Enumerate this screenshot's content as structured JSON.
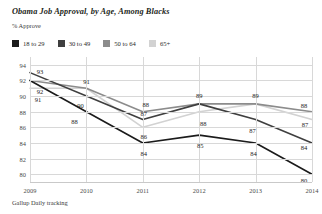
{
  "header": {
    "title": "Obama Job Approval, by Age, Among Blacks",
    "subtitle": "% Approve",
    "source": "Gallup Daily tracking"
  },
  "legend": {
    "items": [
      {
        "label": "18 to 29",
        "color": "#1b1b1b",
        "swatch_name": "legend-swatch-18-to-29"
      },
      {
        "label": "30 to 49",
        "color": "#3f3f3f",
        "swatch_name": "legend-swatch-30-to-49"
      },
      {
        "label": "50 to 64",
        "color": "#8c8c8c",
        "swatch_name": "legend-swatch-50-to-64"
      },
      {
        "label": "65+",
        "color": "#d2d2d2",
        "swatch_name": "legend-swatch-65-plus"
      }
    ]
  },
  "chart_data": {
    "type": "line",
    "title": "Obama Job Approval, by Age, Among Blacks",
    "subtitle": "% Approve",
    "xlabel": "",
    "ylabel": "% Approve",
    "categories": [
      "2009",
      "2010",
      "2011",
      "2012",
      "2013",
      "2014"
    ],
    "x": [
      2009,
      2010,
      2011,
      2012,
      2013,
      2014
    ],
    "ylim": [
      79,
      95
    ],
    "yticks": [
      80,
      82,
      84,
      86,
      88,
      90,
      92,
      94
    ],
    "grid": true,
    "legend_position": "top-left",
    "source": "Gallup Daily tracking",
    "series": [
      {
        "name": "18 to 29",
        "color": "#1b1b1b",
        "values": [
          92,
          88,
          84,
          85,
          84,
          80
        ],
        "labels": [
          "92",
          "88",
          "84",
          "85",
          "84",
          "80"
        ]
      },
      {
        "name": "30 to 49",
        "color": "#3f3f3f",
        "values": [
          93,
          90,
          87,
          89,
          87,
          84
        ],
        "labels": [
          "93",
          "90",
          "87",
          "89",
          "87",
          "84"
        ]
      },
      {
        "name": "50 to 64",
        "color": "#8c8c8c",
        "values": [
          92,
          91,
          88,
          89,
          89,
          88
        ],
        "labels": [
          "92",
          "91",
          "88",
          "89",
          "89",
          "88"
        ]
      },
      {
        "name": "65+",
        "color": "#d2d2d2",
        "values": [
          91,
          91,
          86,
          88,
          89,
          87
        ],
        "labels": [
          "91",
          "91",
          "86",
          "88",
          "89",
          "87"
        ]
      }
    ],
    "point_labels": [
      {
        "text": "93",
        "x": 2009,
        "y": 93,
        "dx": 10,
        "dy": -2
      },
      {
        "text": "92",
        "x": 2009,
        "y": 92,
        "dx": 10,
        "dy": 11
      },
      {
        "text": "91",
        "x": 2009,
        "y": 91,
        "dx": 8,
        "dy": 11
      },
      {
        "text": "91",
        "x": 2010,
        "y": 91,
        "dx": 0,
        "dy": -7
      },
      {
        "text": "90",
        "x": 2010,
        "y": 90,
        "dx": -6,
        "dy": 9
      },
      {
        "text": "88",
        "x": 2010,
        "y": 88,
        "dx": -12,
        "dy": 9
      },
      {
        "text": "88",
        "x": 2011,
        "y": 88,
        "dx": 3,
        "dy": -8
      },
      {
        "text": "87",
        "x": 2011,
        "y": 87,
        "dx": 1,
        "dy": -7
      },
      {
        "text": "86",
        "x": 2011,
        "y": 86,
        "dx": 1,
        "dy": 9
      },
      {
        "text": "84",
        "x": 2011,
        "y": 84,
        "dx": 1,
        "dy": 10
      },
      {
        "text": "89",
        "x": 2012,
        "y": 89,
        "dx": 0,
        "dy": -9
      },
      {
        "text": "88",
        "x": 2012,
        "y": 88,
        "dx": 4,
        "dy": 11
      },
      {
        "text": "85",
        "x": 2012,
        "y": 85,
        "dx": 1,
        "dy": 10
      },
      {
        "text": "89",
        "x": 2013,
        "y": 89,
        "dx": 0,
        "dy": -9
      },
      {
        "text": "87",
        "x": 2013,
        "y": 87,
        "dx": -3,
        "dy": 10
      },
      {
        "text": "84",
        "x": 2013,
        "y": 84,
        "dx": -2,
        "dy": 10
      },
      {
        "text": "88",
        "x": 2014,
        "y": 88,
        "dx": -8,
        "dy": -7
      },
      {
        "text": "87",
        "x": 2014,
        "y": 87,
        "dx": -7,
        "dy": 4
      },
      {
        "text": "84",
        "x": 2014,
        "y": 84,
        "dx": -8,
        "dy": 4
      },
      {
        "text": "80",
        "x": 2014,
        "y": 80,
        "dx": -8,
        "dy": 6
      }
    ]
  }
}
